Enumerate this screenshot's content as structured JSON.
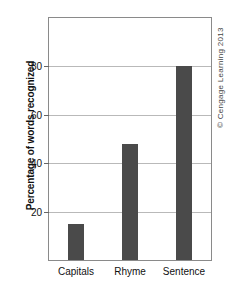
{
  "chart_data": {
    "type": "bar",
    "title": "",
    "xlabel": "",
    "ylabel": "Percentage of words recognized",
    "categories": [
      "Capitals",
      "Rhyme",
      "Sentence"
    ],
    "values": [
      15,
      48,
      80
    ],
    "ylim": [
      0,
      100
    ],
    "yticks": [
      20,
      40,
      60,
      80
    ],
    "ytick_labels": [
      "20",
      "40",
      "60",
      "80"
    ],
    "grid": true,
    "legend": "none",
    "bar_color": "#4a4a4a",
    "axis_color": "#8a8a8a",
    "grid_color": "#b9b9b9",
    "background": "#ffffff"
  },
  "credit": {
    "text": "© Cengage Learning 2013"
  }
}
